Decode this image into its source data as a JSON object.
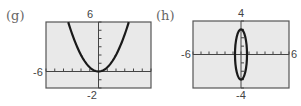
{
  "chart_data": [
    {
      "type": "line",
      "panel_label": "(g)",
      "title": "",
      "xlabel": "",
      "ylabel": "",
      "xlim": [
        -6,
        6
      ],
      "ylim": [
        -2,
        6
      ],
      "tick_labels": {
        "x_min": "-6",
        "x_max": "6",
        "y_min": "-2",
        "y_max": "6"
      },
      "x_ticks": [
        -6,
        -5,
        -4,
        -3,
        -2,
        -1,
        0,
        1,
        2,
        3,
        4,
        5,
        6
      ],
      "y_ticks": [
        -2,
        -1,
        0,
        1,
        2,
        3,
        4,
        5,
        6
      ],
      "grid": false,
      "curve": "parabola y = x^2/2 (vertex at origin, opening upward)",
      "series": [
        {
          "name": "parabola",
          "x": [
            -3.46,
            -3,
            -2,
            -1,
            0,
            1,
            2,
            3,
            3.46
          ],
          "y": [
            6,
            4.5,
            2,
            0.5,
            0,
            0.5,
            2,
            4.5,
            6
          ]
        }
      ]
    },
    {
      "type": "line",
      "panel_label": "(h)",
      "title": "",
      "xlabel": "",
      "ylabel": "",
      "xlim": [
        -6,
        6
      ],
      "ylim": [
        -4,
        4
      ],
      "tick_labels": {
        "x_min": "-6",
        "x_max": "6",
        "y_min": "-4",
        "y_max": "4"
      },
      "x_ticks": [
        -6,
        -5,
        -4,
        -3,
        -2,
        -1,
        0,
        1,
        2,
        3,
        4,
        5,
        6
      ],
      "y_ticks": [
        -4,
        -3,
        -2,
        -1,
        0,
        1,
        2,
        3,
        4
      ],
      "grid": false,
      "curve": "vertical ellipse centered at origin, semi-axis x ≈ 0.75, semi-axis y ≈ 3",
      "series": [
        {
          "name": "ellipse",
          "center": [
            0,
            0
          ],
          "rx": 0.75,
          "ry": 3
        }
      ]
    }
  ],
  "colors": {
    "plot_bg": "#e9e9e9",
    "frame": "#555555",
    "curve": "#1a1a1a",
    "axis": "#444444"
  }
}
